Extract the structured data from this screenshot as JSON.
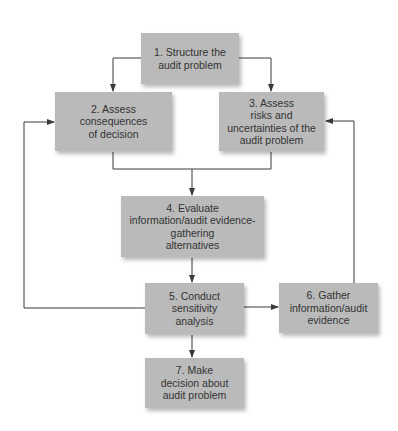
{
  "diagram": {
    "type": "flowchart",
    "colors": {
      "box_fill": "#bababa",
      "text": "#333333",
      "line": "#3a3a3a",
      "background": "#ffffff"
    },
    "nodes": [
      {
        "id": "1",
        "label": "1. Structure the\naudit problem"
      },
      {
        "id": "2",
        "label": "2. Assess\nconsequences\nof decision"
      },
      {
        "id": "3",
        "label": "3. Assess\nrisks and\nuncertainties of the\naudit problem"
      },
      {
        "id": "4",
        "label": "4. Evaluate\ninformation/audit evidence-\ngathering\nalternatives"
      },
      {
        "id": "5",
        "label": "5. Conduct\nsensitivity\nanalysis"
      },
      {
        "id": "6",
        "label": "6. Gather\ninformation/audit\nevidence"
      },
      {
        "id": "7",
        "label": "7. Make\ndecision about\naudit problem"
      }
    ],
    "edges": [
      {
        "from": "1",
        "to": "2"
      },
      {
        "from": "1",
        "to": "3"
      },
      {
        "from": "2",
        "to": "4"
      },
      {
        "from": "3",
        "to": "4"
      },
      {
        "from": "4",
        "to": "5"
      },
      {
        "from": "5",
        "to": "2"
      },
      {
        "from": "5",
        "to": "6"
      },
      {
        "from": "6",
        "to": "3"
      },
      {
        "from": "5",
        "to": "7"
      }
    ]
  }
}
